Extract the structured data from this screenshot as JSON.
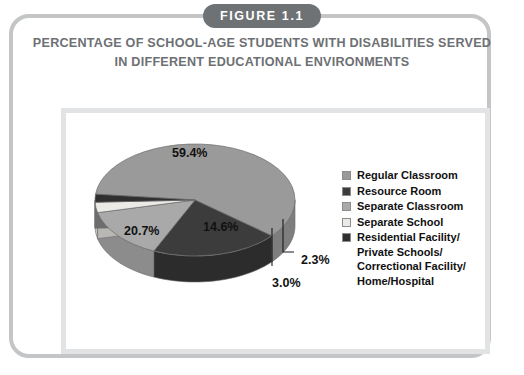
{
  "figure": {
    "badge": "FIGURE 1.1",
    "title_line1": "PERCENTAGE OF SCHOOL-AGE STUDENTS WITH DISABILITIES SERVED",
    "title_line2": "IN DIFFERENT EDUCATIONAL ENVIRONMENTS"
  },
  "colors": {
    "card_border": "#c3c5c7",
    "badge_bg": "#6f7275",
    "title_text": "#6d7074",
    "chart_box_border": "#e2e3e5",
    "label_text": "#111111"
  },
  "chart_data": {
    "type": "pie",
    "title": "PERCENTAGE OF SCHOOL-AGE STUDENTS WITH DISABILITIES SERVED IN DIFFERENT EDUCATIONAL ENVIRONMENTS",
    "xlabel": "",
    "ylabel": "",
    "legend_position": "right",
    "grid": false,
    "three_d": true,
    "categories": [
      "Regular Classroom",
      "Resource Room",
      "Separate Classroom",
      "Separate School",
      "Residential Facility/\nPrivate Schools/\nCorrectional Facility/\nHome/Hospital"
    ],
    "values": [
      59.4,
      20.7,
      14.6,
      3.0,
      2.3
    ],
    "labels": [
      "59.4%",
      "20.7%",
      "14.6%",
      "3.0%",
      "2.3%"
    ],
    "slice_colors": [
      "#9a9a9a",
      "#3c3c3c",
      "#a9a9a9",
      "#eceae7",
      "#2f2f2f"
    ],
    "slice_side_colors": [
      "#7e7e7e",
      "#2c2c2c",
      "#8c8c8c",
      "#c9c7c4",
      "#242424"
    ]
  },
  "legend": {
    "items": [
      {
        "label": "Regular Classroom",
        "color": "#9a9a9a"
      },
      {
        "label": "Resource Room",
        "color": "#3c3c3c"
      },
      {
        "label": "Separate Classroom",
        "color": "#a9a9a9"
      },
      {
        "label": "Separate School",
        "color": "#eceae7"
      },
      {
        "label": "Residential Facility/\nPrivate Schools/\nCorrectional Facility/\nHome/Hospital",
        "color": "#2f2f2f"
      }
    ]
  },
  "pct_labels": [
    {
      "text": "59.4%",
      "x": 172,
      "y": 146
    },
    {
      "text": "20.7%",
      "x": 124,
      "y": 224
    },
    {
      "text": "14.6%",
      "x": 203,
      "y": 220
    },
    {
      "text": "3.0%",
      "x": 272,
      "y": 276
    },
    {
      "text": "2.3%",
      "x": 301,
      "y": 253
    }
  ]
}
